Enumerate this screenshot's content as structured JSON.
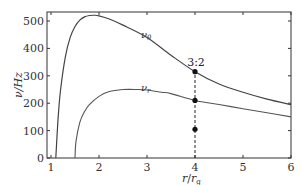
{
  "chart_data": {
    "type": "line",
    "title": "",
    "xlabel": "r/r_g",
    "ylabel": "ν/Hz",
    "xlim": [
      0.92,
      6
    ],
    "ylim": [
      0,
      540
    ],
    "xticks": [
      1,
      2,
      3,
      4,
      5,
      6
    ],
    "yticks": [
      0,
      100,
      200,
      300,
      400,
      500
    ],
    "grid": false,
    "legend": "none (inline curve labels)",
    "series": [
      {
        "name": "ν_θ",
        "label": "νθ",
        "x": [
          1.1,
          1.15,
          1.2,
          1.3,
          1.4,
          1.5,
          1.6,
          1.7,
          1.8,
          1.9,
          2.0,
          2.2,
          2.5,
          3.0,
          3.5,
          4.0,
          4.5,
          5.0,
          5.5,
          6.0
        ],
        "values": [
          0,
          150,
          250,
          370,
          440,
          480,
          503,
          515,
          520,
          521,
          519,
          508,
          485,
          440,
          375,
          315,
          270,
          240,
          215,
          195
        ]
      },
      {
        "name": "ν_r",
        "label": "νr",
        "x": [
          1.5,
          1.52,
          1.6,
          1.7,
          1.8,
          2.0,
          2.2,
          2.5,
          2.8,
          3.0,
          3.3,
          3.5,
          4.0,
          4.5,
          5.0,
          5.5,
          6.0
        ],
        "values": [
          0,
          60,
          130,
          170,
          195,
          225,
          242,
          250,
          250,
          248,
          240,
          235,
          210,
          195,
          180,
          165,
          150
        ]
      }
    ],
    "markers": [
      {
        "x": 4,
        "y": 315
      },
      {
        "x": 4,
        "y": 210
      },
      {
        "x": 4,
        "y": 105
      }
    ],
    "vline": {
      "x": 4,
      "y_from": 0,
      "y_to": 315,
      "style": "dashed"
    },
    "annotations": [
      {
        "text": "3:2",
        "x": 4,
        "y": 345
      }
    ]
  },
  "labels": {
    "xlabel_main": "r",
    "xlabel_slash": "/",
    "xlabel_den": "r",
    "xlabel_sub": "g",
    "ylabel": "ν/Hz",
    "nu": "ν",
    "theta_sub": "θ",
    "r_sub": "r",
    "annot": "3:2",
    "yticks": [
      "0",
      "100",
      "200",
      "300",
      "400",
      "500"
    ],
    "xticks": [
      "1",
      "2",
      "3",
      "4",
      "5",
      "6"
    ]
  }
}
